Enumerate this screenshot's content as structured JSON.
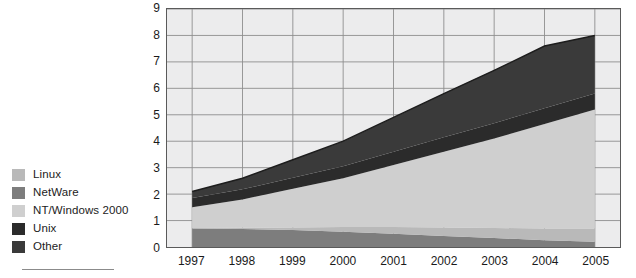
{
  "legend": {
    "items": [
      {
        "label": "Linux",
        "color": "#b9b9b9"
      },
      {
        "label": "NetWare",
        "color": "#7d7d7d"
      },
      {
        "label": "NT/Windows 2000",
        "color": "#cfcfcf"
      },
      {
        "label": "Unix",
        "color": "#2b2b2b"
      },
      {
        "label": "Other",
        "color": "#3a3a3a"
      }
    ]
  },
  "chart_data": {
    "type": "area",
    "stacked": true,
    "title": "",
    "subtitle": "",
    "xlabel": "",
    "ylabel": "Shipments (in millions)",
    "xlim": [
      1996.5,
      2005.5
    ],
    "ylim": [
      0,
      9
    ],
    "yticks": [
      0,
      1,
      2,
      3,
      4,
      5,
      6,
      7,
      8,
      9
    ],
    "grid": true,
    "grid_axis": "both",
    "legend_position": "left-outside",
    "categories": [
      "1997",
      "1998",
      "1999",
      "2000",
      "2001",
      "2002",
      "2003",
      "2004",
      "2005"
    ],
    "x": [
      1997,
      1998,
      1999,
      2000,
      2001,
      2002,
      2003,
      2004,
      2005
    ],
    "stack_order_bottom_to_top": [
      "NetWare",
      "Linux",
      "NT/Windows 2000",
      "Unix",
      "Other"
    ],
    "series": [
      {
        "name": "NetWare",
        "color": "#7d7d7d",
        "values": [
          0.7,
          0.68,
          0.64,
          0.58,
          0.5,
          0.42,
          0.34,
          0.26,
          0.2
        ]
      },
      {
        "name": "Linux",
        "color": "#b9b9b9",
        "values": [
          0.02,
          0.05,
          0.1,
          0.18,
          0.26,
          0.32,
          0.38,
          0.44,
          0.5
        ]
      },
      {
        "name": "NT/Windows 2000",
        "color": "#cfcfcf",
        "values": [
          0.78,
          1.07,
          1.46,
          1.84,
          2.34,
          2.86,
          3.38,
          3.95,
          4.5
        ]
      },
      {
        "name": "Unix",
        "color": "#2b2b2b",
        "values": [
          0.35,
          0.38,
          0.42,
          0.45,
          0.5,
          0.55,
          0.58,
          0.6,
          0.6
        ]
      },
      {
        "name": "Other",
        "color": "#3a3a3a",
        "values": [
          0.25,
          0.42,
          0.68,
          0.95,
          1.3,
          1.65,
          2.0,
          2.35,
          2.2
        ]
      }
    ],
    "totals": [
      2.1,
      2.6,
      3.3,
      4.0,
      4.9,
      5.8,
      6.68,
      7.6,
      8.0
    ],
    "annotations": []
  }
}
